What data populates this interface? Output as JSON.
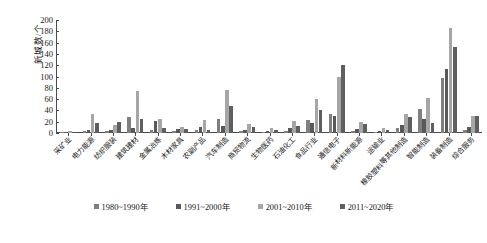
{
  "chart_data": {
    "type": "bar",
    "title": "",
    "xlabel": "",
    "ylabel": "新城数/个",
    "ylim": [
      0,
      200
    ],
    "ytick_step": 20,
    "yticks": [
      0,
      20,
      40,
      60,
      80,
      100,
      120,
      140,
      160,
      180,
      200
    ],
    "grid": false,
    "legend_position": "bottom",
    "categories": [
      "采矿业",
      "电力能源",
      "纺织服装",
      "建筑建材",
      "金属冶炼",
      "木材家具",
      "农副产品",
      "汽车制造",
      "商贸物流",
      "生物医药",
      "石油化工",
      "食品行业",
      "通信电子",
      "新材料新能源",
      "运输业",
      "橡胶塑料等其他制造",
      "智能制造",
      "装备制造",
      "综合服务"
    ],
    "series": [
      {
        "name": "1980~1990年",
        "color": "#7f7f7f",
        "values": [
          1,
          4,
          3,
          28,
          5,
          4,
          6,
          25,
          3,
          2,
          4,
          23,
          34,
          4,
          2,
          8,
          42,
          98,
          5
        ]
      },
      {
        "name": "1991~2000年",
        "color": "#595959",
        "values": [
          2,
          6,
          5,
          9,
          21,
          7,
          11,
          13,
          5,
          4,
          8,
          17,
          30,
          7,
          4,
          14,
          25,
          113,
          10
        ]
      },
      {
        "name": "2001~2010年",
        "color": "#a6a6a6",
        "values": [
          3,
          33,
          14,
          75,
          25,
          11,
          23,
          76,
          16,
          9,
          21,
          60,
          99,
          19,
          9,
          34,
          62,
          185,
          30
        ]
      },
      {
        "name": "2011~2020年",
        "color": "#5f5f5f",
        "values": [
          2,
          17,
          20,
          25,
          9,
          7,
          6,
          47,
          10,
          5,
          12,
          40,
          121,
          16,
          6,
          29,
          18,
          153,
          31
        ]
      }
    ]
  },
  "legend": {
    "items": [
      {
        "label": "1980~1990年",
        "color": "#7f7f7f"
      },
      {
        "label": "1991~2000年",
        "color": "#595959"
      },
      {
        "label": "2001~2010年",
        "color": "#a6a6a6"
      },
      {
        "label": "2011~2020年",
        "color": "#5f5f5f"
      }
    ]
  }
}
